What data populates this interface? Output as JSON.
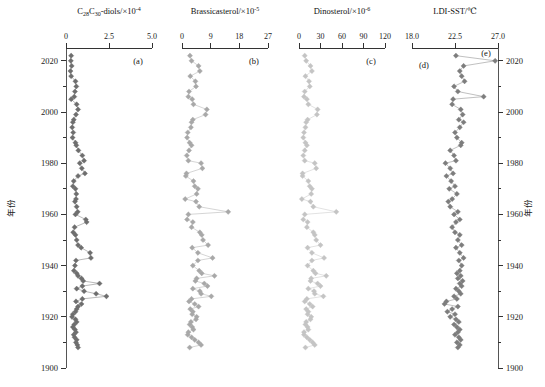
{
  "figure": {
    "y_axis_name_left": "年份",
    "y_axis_name_right": "年份",
    "year_ticks": [
      2020,
      2000,
      1980,
      1960,
      1940,
      1920,
      1900
    ],
    "year_range": [
      1900,
      2025
    ]
  },
  "chart_data": [
    {
      "type": "line",
      "panel": "a",
      "panel_letter": "(a)",
      "title": "C28C30-diols/×10-4",
      "title_parts": {
        "base1": "C",
        "sub1": "28",
        "base2": "C",
        "sub2": "30",
        "rest": "-diols/×10",
        "exp": "-4"
      },
      "xlabel": "C28C30-diols/×10⁻⁴",
      "ylabel": "年份",
      "color": "#6e6e6e",
      "line_color": "#8a8a8a",
      "xlim": [
        0,
        5.0
      ],
      "xticks": [
        0,
        2.5,
        5.0
      ],
      "xtick_labels": [
        "0",
        "2.5",
        "5.0"
      ],
      "ylim": [
        1900,
        2025
      ],
      "grid": false,
      "x": [
        0.3,
        0.28,
        0.33,
        0.26,
        0.3,
        0.55,
        0.6,
        0.52,
        0.48,
        0.3,
        0.62,
        0.7,
        0.58,
        0.45,
        0.4,
        0.36,
        0.42,
        0.38,
        0.55,
        0.6,
        0.72,
        0.95,
        1.05,
        0.8,
        0.92,
        1.1,
        0.7,
        0.45,
        0.4,
        0.55,
        0.6,
        0.58,
        0.52,
        0.62,
        0.68,
        0.55,
        1.15,
        1.2,
        0.5,
        0.42,
        0.55,
        0.62,
        0.7,
        0.88,
        1.4,
        1.45,
        0.58,
        0.52,
        0.46,
        0.62,
        0.7,
        0.9,
        1.0,
        1.95,
        0.95,
        0.62,
        1.05,
        1.75,
        2.35,
        0.95,
        0.58,
        0.9,
        0.7,
        0.62,
        0.55,
        0.4,
        0.35,
        0.55,
        0.62,
        0.48,
        0.4,
        0.52,
        0.58,
        0.45,
        0.5,
        0.62,
        0.58,
        0.66,
        0.7
      ],
      "y": [
        2022,
        2020,
        2018,
        2016,
        2014,
        2012,
        2010,
        2008,
        2006,
        2005,
        2003,
        2001,
        1999,
        1997,
        1996,
        1994,
        1992,
        1990,
        1988,
        1987,
        1985,
        1983,
        1981,
        1980,
        1978,
        1976,
        1975,
        1973,
        1971,
        1970,
        1968,
        1966,
        1965,
        1963,
        1961,
        1960,
        1958,
        1957,
        1955,
        1953,
        1952,
        1950,
        1948,
        1947,
        1945,
        1943,
        1942,
        1940,
        1938,
        1937,
        1936,
        1935,
        1934,
        1933,
        1932,
        1931,
        1930,
        1929,
        1928,
        1927,
        1926,
        1925,
        1924,
        1923,
        1922,
        1921,
        1920,
        1919,
        1918,
        1917,
        1916,
        1915,
        1914,
        1913,
        1912,
        1911,
        1910,
        1909,
        1908
      ]
    },
    {
      "type": "line",
      "panel": "b",
      "panel_letter": "(b)",
      "title": "Brassicasterol/×10-5",
      "title_parts": {
        "rest": "Brassicasterol/×10",
        "exp": "-5"
      },
      "xlabel": "Brassicasterol/×10⁻⁵",
      "ylabel": "年份",
      "color": "#a8a8a8",
      "line_color": "#b8b8b8",
      "xlim": [
        0,
        27
      ],
      "xticks": [
        0,
        9,
        18,
        27
      ],
      "xtick_labels": [
        "0",
        "9",
        "18",
        "27"
      ],
      "ylim": [
        1900,
        2025
      ],
      "grid": false,
      "x": [
        2.5,
        3.0,
        5.2,
        5.6,
        2.6,
        4.2,
        4.4,
        2.2,
        2.0,
        3.2,
        3.6,
        7.8,
        7.4,
        3.4,
        3.0,
        2.8,
        1.8,
        1.6,
        2.4,
        3.0,
        2.2,
        1.5,
        2.0,
        6.0,
        6.4,
        1.4,
        1.2,
        3.6,
        4.0,
        5.0,
        4.6,
        1.0,
        4.4,
        5.4,
        14.5,
        2.0,
        1.6,
        3.4,
        3.0,
        5.6,
        6.2,
        6.6,
        8.2,
        3.2,
        5.0,
        9.6,
        5.0,
        3.4,
        5.4,
        6.2,
        10.2,
        4.6,
        4.2,
        7.0,
        8.0,
        3.4,
        5.6,
        6.0,
        9.2,
        3.0,
        2.2,
        4.0,
        5.2,
        2.6,
        3.4,
        3.2,
        4.6,
        4.4,
        2.8,
        2.4,
        3.2,
        3.6,
        2.0,
        1.8,
        3.0,
        4.0,
        5.2,
        6.0,
        2.4
      ],
      "y": [
        2022,
        2020,
        2018,
        2016,
        2014,
        2012,
        2010,
        2008,
        2006,
        2005,
        2003,
        2001,
        1999,
        1997,
        1996,
        1994,
        1992,
        1990,
        1988,
        1987,
        1985,
        1983,
        1981,
        1980,
        1978,
        1976,
        1975,
        1973,
        1971,
        1970,
        1968,
        1966,
        1965,
        1963,
        1961,
        1960,
        1958,
        1957,
        1955,
        1953,
        1952,
        1950,
        1948,
        1947,
        1945,
        1943,
        1942,
        1940,
        1938,
        1937,
        1936,
        1935,
        1934,
        1933,
        1932,
        1931,
        1930,
        1929,
        1928,
        1927,
        1926,
        1925,
        1924,
        1923,
        1922,
        1921,
        1920,
        1919,
        1918,
        1917,
        1916,
        1915,
        1914,
        1913,
        1912,
        1911,
        1910,
        1909,
        1908
      ]
    },
    {
      "type": "line",
      "panel": "c",
      "panel_letter": "(c)",
      "title": "Dinosterol/×10-6",
      "title_parts": {
        "rest": "Dinosterol/×10",
        "exp": "-6"
      },
      "xlabel": "Dinosterol/×10⁻⁶",
      "ylabel": "年份",
      "color": "#c4c4c4",
      "line_color": "#cfcfcf",
      "xlim": [
        0,
        120
      ],
      "xticks": [
        0,
        30,
        60,
        90,
        120
      ],
      "xtick_labels": [
        "0",
        "30",
        "60",
        "90",
        "120"
      ],
      "ylim": [
        1900,
        2025
      ],
      "grid": false,
      "x": [
        8,
        10,
        16,
        18,
        9,
        14,
        15,
        8,
        7,
        11,
        13,
        26,
        25,
        12,
        10,
        9,
        7,
        6,
        9,
        11,
        8,
        6,
        8,
        22,
        24,
        5,
        5,
        13,
        15,
        18,
        17,
        4,
        16,
        20,
        52,
        8,
        6,
        12,
        11,
        20,
        22,
        24,
        30,
        12,
        18,
        35,
        18,
        12,
        20,
        23,
        38,
        17,
        16,
        26,
        30,
        13,
        21,
        22,
        34,
        11,
        8,
        15,
        19,
        10,
        13,
        12,
        17,
        16,
        10,
        9,
        12,
        13,
        7,
        7,
        11,
        15,
        19,
        22,
        9
      ],
      "y": [
        2022,
        2020,
        2018,
        2016,
        2014,
        2012,
        2010,
        2008,
        2006,
        2005,
        2003,
        2001,
        1999,
        1997,
        1996,
        1994,
        1992,
        1990,
        1988,
        1987,
        1985,
        1983,
        1981,
        1980,
        1978,
        1976,
        1975,
        1973,
        1971,
        1970,
        1968,
        1966,
        1965,
        1963,
        1961,
        1960,
        1958,
        1957,
        1955,
        1953,
        1952,
        1950,
        1948,
        1947,
        1945,
        1943,
        1942,
        1940,
        1938,
        1937,
        1936,
        1935,
        1934,
        1933,
        1932,
        1931,
        1930,
        1929,
        1928,
        1927,
        1926,
        1925,
        1924,
        1923,
        1922,
        1921,
        1920,
        1919,
        1918,
        1917,
        1916,
        1915,
        1914,
        1913,
        1912,
        1911,
        1910,
        1909,
        1908
      ]
    },
    {
      "type": "line",
      "panel": "de",
      "panel_letter": "(d)",
      "panel_letter_secondary": "(e)",
      "title": "LDI-SST/℃",
      "title_parts": {
        "rest": "LDI-SST/℃",
        "exp": ""
      },
      "xlabel": "LDI-SST/℃",
      "ylabel": "年份",
      "color": "#7d7d7d",
      "line_color": "#969696",
      "xlim": [
        18.0,
        27.0
      ],
      "xticks": [
        18.0,
        22.5,
        27.0
      ],
      "xtick_labels": [
        "18.0",
        "22.5",
        "27.0"
      ],
      "ylim": [
        1900,
        2025
      ],
      "grid": false,
      "x": [
        22.6,
        26.7,
        23.4,
        23.0,
        23.2,
        23.5,
        22.4,
        22.8,
        25.5,
        22.3,
        22.2,
        23.1,
        23.3,
        22.9,
        23.4,
        23.0,
        22.5,
        22.7,
        23.2,
        23.1,
        22.0,
        22.4,
        22.6,
        21.5,
        22.0,
        22.3,
        21.6,
        22.1,
        22.5,
        21.9,
        22.7,
        22.2,
        21.8,
        22.0,
        22.8,
        22.4,
        23.0,
        22.6,
        22.2,
        22.5,
        23.0,
        22.8,
        23.2,
        22.6,
        23.0,
        23.4,
        22.9,
        23.2,
        23.0,
        22.7,
        23.1,
        22.8,
        23.3,
        23.0,
        23.2,
        22.6,
        22.9,
        23.1,
        22.4,
        22.7,
        21.6,
        21.4,
        22.8,
        22.2,
        21.7,
        22.5,
        22.0,
        22.6,
        22.9,
        22.4,
        22.7,
        23.0,
        22.8,
        22.5,
        22.9,
        23.1,
        22.7,
        23.0,
        22.8
      ],
      "y": [
        2022,
        2020,
        2018,
        2016,
        2014,
        2012,
        2010,
        2008,
        2006,
        2005,
        2003,
        2001,
        1999,
        1997,
        1996,
        1994,
        1992,
        1990,
        1988,
        1987,
        1985,
        1983,
        1981,
        1980,
        1978,
        1976,
        1975,
        1973,
        1971,
        1970,
        1968,
        1966,
        1965,
        1963,
        1961,
        1960,
        1958,
        1957,
        1955,
        1953,
        1952,
        1950,
        1948,
        1947,
        1945,
        1943,
        1942,
        1940,
        1938,
        1937,
        1936,
        1935,
        1934,
        1933,
        1932,
        1931,
        1930,
        1929,
        1928,
        1927,
        1926,
        1925,
        1924,
        1923,
        1922,
        1921,
        1920,
        1919,
        1918,
        1917,
        1916,
        1915,
        1914,
        1913,
        1912,
        1911,
        1910,
        1909,
        1908
      ]
    }
  ]
}
